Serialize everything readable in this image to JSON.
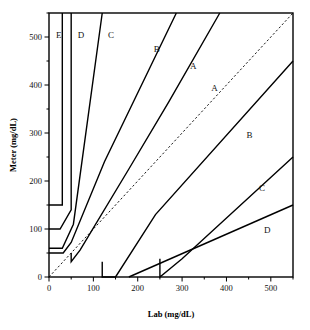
{
  "chart_data": {
    "type": "line",
    "title": "",
    "xlabel": "Lab (mg/dL)",
    "ylabel": "Meter (mg/dL)",
    "xlim": [
      0,
      550
    ],
    "ylim": [
      0,
      550
    ],
    "grid": false,
    "legend": null,
    "xticks_major": [
      0,
      100,
      200,
      300,
      400,
      500
    ],
    "xticks_minor": [
      50,
      150,
      250,
      350,
      450,
      550
    ],
    "yticks_major": [
      0,
      100,
      200,
      300,
      400,
      500
    ],
    "yticks_minor": [
      50,
      150,
      250,
      350,
      450,
      550
    ],
    "xtick_labels": [
      "0",
      "100",
      "200",
      "300",
      "400",
      "500"
    ],
    "ytick_labels": [
      "0",
      "100",
      "200",
      "300",
      "400",
      "500"
    ],
    "annotations": [
      {
        "text": "E",
        "x": 22,
        "y": 505
      },
      {
        "text": "D",
        "x": 72,
        "y": 505
      },
      {
        "text": "C",
        "x": 140,
        "y": 505
      },
      {
        "text": "B",
        "x": 243,
        "y": 475
      },
      {
        "text": "A",
        "x": 325,
        "y": 440
      },
      {
        "text": "A",
        "x": 373,
        "y": 393
      },
      {
        "text": "B",
        "x": 452,
        "y": 295
      },
      {
        "text": "C",
        "x": 480,
        "y": 185
      },
      {
        "text": "D",
        "x": 492,
        "y": 98
      }
    ],
    "series": [
      {
        "name": "identity-line",
        "style": "dashed",
        "points": [
          [
            0,
            0
          ],
          [
            550,
            550
          ]
        ]
      },
      {
        "name": "zone-E-upper-boundary",
        "style": "solid",
        "points": [
          [
            0,
            150
          ],
          [
            30,
            150
          ],
          [
            30,
            550
          ]
        ]
      },
      {
        "name": "zone-D-upper-left-boundary",
        "style": "solid",
        "points": [
          [
            0,
            100
          ],
          [
            25,
            100
          ],
          [
            50,
            140
          ],
          [
            50,
            550
          ]
        ]
      },
      {
        "name": "zone-C-upper-left-boundary",
        "style": "solid",
        "points": [
          [
            0,
            60
          ],
          [
            30,
            60
          ],
          [
            55,
            110
          ],
          [
            120,
            550
          ]
        ]
      },
      {
        "name": "zone-B-upper-boundary",
        "style": "solid",
        "points": [
          [
            0,
            50
          ],
          [
            32,
            50
          ],
          [
            50,
            72
          ],
          [
            125,
            240
          ],
          [
            287,
            550
          ]
        ]
      },
      {
        "name": "zone-A-upper-boundary",
        "style": "solid",
        "points": [
          [
            50,
            50
          ],
          [
            50,
            32
          ],
          [
            70,
            56
          ],
          [
            180,
            225
          ],
          [
            270,
            365
          ],
          [
            385,
            550
          ]
        ]
      },
      {
        "name": "zone-A-lower-boundary",
        "style": "solid",
        "points": [
          [
            120,
            32
          ],
          [
            120,
            0
          ],
          [
            150,
            0
          ],
          [
            240,
            130
          ],
          [
            550,
            450
          ]
        ]
      },
      {
        "name": "zone-B-lower-boundary",
        "style": "solid",
        "points": [
          [
            250,
            38
          ],
          [
            250,
            0
          ],
          [
            300,
            38
          ],
          [
            550,
            250
          ]
        ]
      },
      {
        "name": "zone-C-lower-boundary",
        "style": "solid",
        "points": [
          [
            180,
            0
          ],
          [
            550,
            150
          ]
        ]
      }
    ]
  },
  "axes": {
    "x_title": "Lab (mg/dL)",
    "y_title": "Meter (mg/dL)"
  }
}
